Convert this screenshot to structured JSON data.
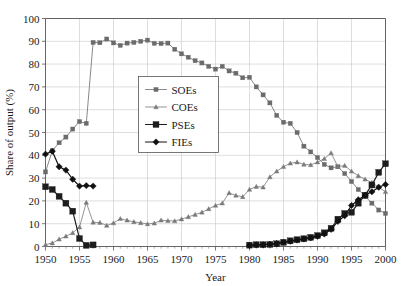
{
  "chart_data": {
    "type": "line",
    "title": "",
    "xlabel": "Year",
    "ylabel": "Share of output (%)",
    "xlim": [
      1950,
      2000
    ],
    "ylim": [
      0,
      100
    ],
    "xticks": [
      1950,
      1955,
      1960,
      1965,
      1970,
      1975,
      1980,
      1985,
      1990,
      1995,
      2000
    ],
    "yticks": [
      0,
      10,
      20,
      30,
      40,
      50,
      60,
      70,
      80,
      90,
      100
    ],
    "xtick_labels": [
      "1950",
      "1955",
      "1960",
      "1965",
      "1970",
      "1975",
      "1980",
      "1985",
      "1990",
      "1995",
      "2000"
    ],
    "ytick_labels": [
      "0",
      "10",
      "20",
      "30",
      "40",
      "50",
      "60",
      "70",
      "80",
      "90",
      "100"
    ],
    "grid": true,
    "minor_xticks": true,
    "legend_position": "upper-center-left",
    "legend_entries": [
      "SOEs",
      "COEs",
      "PSEs",
      "FIEs"
    ],
    "series": [
      {
        "name": "SOEs",
        "color": "#6b6b6b",
        "marker": "square-small",
        "marker_size": 2.1,
        "line_width": 0.8,
        "x": [
          1950,
          1951,
          1952,
          1953,
          1954,
          1955,
          1956,
          1957,
          1958,
          1959,
          1960,
          1961,
          1962,
          1963,
          1964,
          1965,
          1966,
          1967,
          1968,
          1969,
          1970,
          1971,
          1972,
          1973,
          1974,
          1975,
          1976,
          1977,
          1978,
          1979,
          1980,
          1981,
          1982,
          1983,
          1984,
          1985,
          1986,
          1987,
          1988,
          1989,
          1990,
          1991,
          1992,
          1993,
          1994,
          1995,
          1996,
          1997,
          1998,
          1999,
          2000
        ],
        "y": [
          32.7,
          42.0,
          45.5,
          48.0,
          51.5,
          54.8,
          54.0,
          89.5,
          89.4,
          91.0,
          89.3,
          88.2,
          89.2,
          89.5,
          90.0,
          90.5,
          89.1,
          89.0,
          89.2,
          86.5,
          84.5,
          83.0,
          81.5,
          80.5,
          79.0,
          77.8,
          79.0,
          77.0,
          76.0,
          74.0,
          74.2,
          70.0,
          66.5,
          63.0,
          57.5,
          54.5,
          54.0,
          50.0,
          44.0,
          41.5,
          39.0,
          36.0,
          34.5,
          35.0,
          32.0,
          28.5,
          25.0,
          22.0,
          19.0,
          16.0,
          14.5
        ]
      },
      {
        "name": "COEs",
        "color": "#7a7a7a",
        "marker": "triangle-small",
        "marker_size": 2.3,
        "line_width": 0.8,
        "x": [
          1950,
          1951,
          1952,
          1953,
          1954,
          1955,
          1956,
          1957,
          1958,
          1959,
          1960,
          1961,
          1962,
          1963,
          1964,
          1965,
          1966,
          1967,
          1968,
          1969,
          1970,
          1971,
          1972,
          1973,
          1974,
          1975,
          1976,
          1977,
          1978,
          1979,
          1980,
          1981,
          1982,
          1983,
          1984,
          1985,
          1986,
          1987,
          1988,
          1989,
          1990,
          1991,
          1992,
          1993,
          1994,
          1995,
          1996,
          1997,
          1998,
          1999,
          2000
        ],
        "y": [
          0.8,
          1.5,
          3.2,
          4.5,
          6.0,
          8.5,
          19.3,
          10.6,
          10.5,
          9.2,
          10.3,
          12.2,
          11.5,
          10.8,
          10.4,
          9.9,
          10.2,
          11.5,
          11.3,
          11.2,
          12.0,
          13.0,
          14.0,
          15.0,
          16.5,
          18.0,
          19.0,
          23.5,
          22.4,
          21.8,
          25.0,
          26.3,
          26.0,
          30.5,
          33.0,
          35.0,
          36.5,
          37.0,
          36.0,
          35.8,
          37.0,
          38.5,
          41.0,
          35.0,
          35.5,
          33.0,
          31.0,
          29.5,
          28.0,
          26.0,
          24.0
        ]
      },
      {
        "name": "PSEs",
        "color": "#1d1d1d",
        "marker": "square-large",
        "marker_size": 3.0,
        "line_width": 1.2,
        "segments": [
          {
            "x": [
              1950,
              1951,
              1952,
              1953,
              1954,
              1955,
              1956,
              1957
            ],
            "y": [
              26.2,
              25.0,
              22.0,
              19.0,
              15.5,
              3.5,
              0.5,
              0.7
            ]
          },
          {
            "x": [
              1980,
              1981,
              1982,
              1983,
              1984,
              1985,
              1986,
              1987,
              1988,
              1989,
              1990,
              1991,
              1992,
              1993,
              1994,
              1995,
              1996,
              1997,
              1998,
              1999,
              2000
            ],
            "y": [
              0.6,
              0.8,
              0.8,
              0.9,
              1.2,
              1.8,
              2.5,
              3.0,
              3.4,
              4.0,
              4.8,
              6.0,
              8.0,
              12.0,
              14.5,
              15.0,
              19.0,
              22.5,
              27.0,
              32.5,
              36.3
            ]
          }
        ]
      },
      {
        "name": "FIEs",
        "color": "#111111",
        "marker": "diamond",
        "marker_size": 3.2,
        "line_width": 1.2,
        "segments": [
          {
            "x": [
              1950,
              1951,
              1952,
              1953,
              1954,
              1955,
              1956,
              1957
            ],
            "y": [
              40.5,
              41.8,
              35.0,
              33.5,
              29.5,
              26.5,
              26.7,
              26.5
            ]
          },
          {
            "x": [
              1980,
              1981,
              1982,
              1983,
              1984,
              1985,
              1986,
              1987,
              1988,
              1989,
              1990,
              1991,
              1992,
              1993,
              1994,
              1995,
              1996,
              1997,
              1998,
              1999,
              2000
            ],
            "y": [
              0.5,
              0.7,
              0.8,
              1.0,
              1.3,
              1.9,
              2.3,
              2.8,
              3.3,
              3.8,
              4.5,
              5.5,
              7.5,
              11.0,
              13.5,
              18.0,
              20.5,
              22.5,
              24.0,
              26.0,
              27.2
            ]
          }
        ]
      }
    ]
  }
}
